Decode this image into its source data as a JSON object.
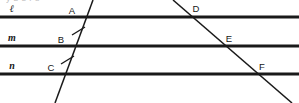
{
  "figure": {
    "clipped_header_text": "y  b  e  r  s",
    "width": 299,
    "height": 103,
    "background_color": "#ffffff",
    "stroke_color": "#1a1a1a"
  },
  "parallel_lines": [
    {
      "label": "ℓ",
      "y": 17,
      "x_start": 0,
      "x_end": 299,
      "label_x": 12,
      "label_y": 12
    },
    {
      "label": "m",
      "y": 46,
      "x_start": 0,
      "x_end": 299,
      "label_x": 12,
      "label_y": 41
    },
    {
      "label": "n",
      "y": 74,
      "x_start": 0,
      "x_end": 299,
      "label_x": 12,
      "label_y": 69
    }
  ],
  "transversals": [
    {
      "name": "left-transversal",
      "x1": 55,
      "y1": 103,
      "x2": 93,
      "y2": 0,
      "has_tick_marks": true,
      "tick_count": 2
    },
    {
      "name": "right-transversal",
      "x1": 173,
      "y1": 0,
      "x2": 292,
      "y2": 103,
      "has_tick_marks": false,
      "tick_count": 0
    }
  ],
  "intersection_points": [
    {
      "label": "A",
      "on_line": "ℓ",
      "transversal": "left",
      "x": 83,
      "y": 17,
      "label_x": 72,
      "label_y": 14
    },
    {
      "label": "B",
      "on_line": "m",
      "transversal": "left",
      "x": 72,
      "y": 46,
      "label_x": 61,
      "label_y": 43
    },
    {
      "label": "C",
      "on_line": "n",
      "transversal": "left",
      "x": 62,
      "y": 74,
      "label_x": 51,
      "label_y": 71
    },
    {
      "label": "D",
      "on_line": "ℓ",
      "transversal": "right",
      "x": 193,
      "y": 17,
      "label_x": 196,
      "label_y": 12
    },
    {
      "label": "E",
      "on_line": "m",
      "transversal": "right",
      "x": 226,
      "y": 46,
      "label_x": 229,
      "label_y": 42
    },
    {
      "label": "F",
      "on_line": "n",
      "transversal": "right",
      "x": 259,
      "y": 74,
      "label_x": 262,
      "label_y": 70
    }
  ],
  "tick_marks": [
    {
      "name": "tick-segment-AB",
      "segment": "AB",
      "cx": 78,
      "cy": 31,
      "angle_deg": 38
    },
    {
      "name": "tick-segment-BC",
      "segment": "BC",
      "cx": 67,
      "cy": 60,
      "angle_deg": 38
    }
  ]
}
